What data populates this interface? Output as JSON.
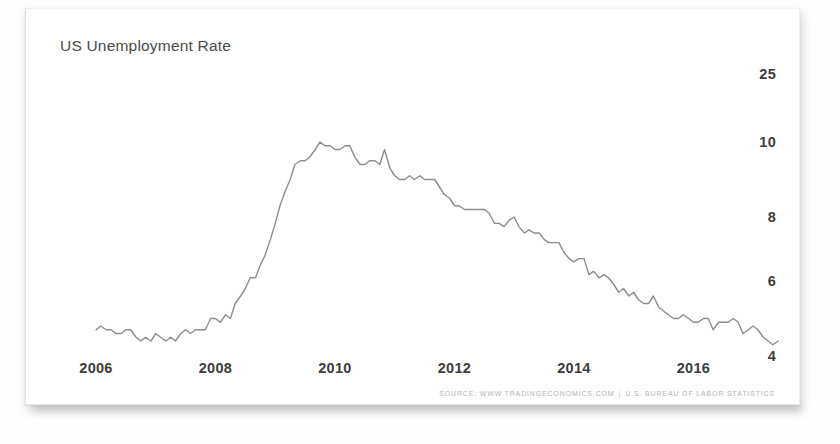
{
  "chart_data": {
    "type": "line",
    "title": "US Unemployment Rate",
    "xlabel": "",
    "ylabel": "",
    "grid": false,
    "legend": null,
    "ylim": [
      4,
      25
    ],
    "xlim": [
      2006.0,
      2017.5
    ],
    "y_ticks": [
      25,
      10,
      8,
      6,
      4
    ],
    "x_ticks": [
      2006,
      2008,
      2010,
      2012,
      2014,
      2016
    ],
    "line_color": "#8d8d8d",
    "units": "percent",
    "series": [
      {
        "name": "US Unemployment Rate",
        "x": [
          2006.0,
          2006.08,
          2006.17,
          2006.25,
          2006.33,
          2006.42,
          2006.5,
          2006.58,
          2006.67,
          2006.75,
          2006.83,
          2006.92,
          2007.0,
          2007.08,
          2007.17,
          2007.25,
          2007.33,
          2007.42,
          2007.5,
          2007.58,
          2007.67,
          2007.75,
          2007.83,
          2007.92,
          2008.0,
          2008.08,
          2008.17,
          2008.25,
          2008.33,
          2008.42,
          2008.5,
          2008.58,
          2008.67,
          2008.75,
          2008.83,
          2008.92,
          2009.0,
          2009.08,
          2009.17,
          2009.25,
          2009.33,
          2009.42,
          2009.5,
          2009.58,
          2009.67,
          2009.75,
          2009.83,
          2009.92,
          2010.0,
          2010.08,
          2010.17,
          2010.25,
          2010.33,
          2010.42,
          2010.5,
          2010.58,
          2010.67,
          2010.75,
          2010.83,
          2010.92,
          2011.0,
          2011.08,
          2011.17,
          2011.25,
          2011.33,
          2011.42,
          2011.5,
          2011.58,
          2011.67,
          2011.75,
          2011.83,
          2011.92,
          2012.0,
          2012.08,
          2012.17,
          2012.25,
          2012.33,
          2012.42,
          2012.5,
          2012.58,
          2012.67,
          2012.75,
          2012.83,
          2012.92,
          2013.0,
          2013.08,
          2013.17,
          2013.25,
          2013.33,
          2013.42,
          2013.5,
          2013.58,
          2013.67,
          2013.75,
          2013.83,
          2013.92,
          2014.0,
          2014.08,
          2014.17,
          2014.25,
          2014.33,
          2014.42,
          2014.5,
          2014.58,
          2014.67,
          2014.75,
          2014.83,
          2014.92,
          2015.0,
          2015.08,
          2015.17,
          2015.25,
          2015.33,
          2015.42,
          2015.5,
          2015.58,
          2015.67,
          2015.75,
          2015.83,
          2015.92,
          2016.0,
          2016.08,
          2016.17,
          2016.25,
          2016.33,
          2016.42,
          2016.5,
          2016.58,
          2016.67,
          2016.75,
          2016.83,
          2016.92,
          2017.0,
          2017.08,
          2017.17,
          2017.25,
          2017.33,
          2017.42
        ],
        "values": [
          4.7,
          4.8,
          4.7,
          4.7,
          4.6,
          4.6,
          4.7,
          4.7,
          4.5,
          4.4,
          4.5,
          4.4,
          4.6,
          4.5,
          4.4,
          4.5,
          4.4,
          4.6,
          4.7,
          4.6,
          4.7,
          4.7,
          4.7,
          5.0,
          5.0,
          4.9,
          5.1,
          5.0,
          5.4,
          5.6,
          5.8,
          6.1,
          6.1,
          6.5,
          6.8,
          7.3,
          7.8,
          8.3,
          8.7,
          9.0,
          9.4,
          9.5,
          9.5,
          9.6,
          9.8,
          10.0,
          9.9,
          9.9,
          9.8,
          9.8,
          9.9,
          9.9,
          9.6,
          9.4,
          9.4,
          9.5,
          9.5,
          9.4,
          9.8,
          9.3,
          9.1,
          9.0,
          9.0,
          9.1,
          9.0,
          9.1,
          9.0,
          9.0,
          9.0,
          8.8,
          8.6,
          8.5,
          8.3,
          8.3,
          8.2,
          8.2,
          8.2,
          8.2,
          8.2,
          8.1,
          7.8,
          7.8,
          7.7,
          7.9,
          8.0,
          7.7,
          7.5,
          7.6,
          7.5,
          7.5,
          7.3,
          7.2,
          7.2,
          7.2,
          6.9,
          6.7,
          6.6,
          6.7,
          6.7,
          6.2,
          6.3,
          6.1,
          6.2,
          6.1,
          5.9,
          5.7,
          5.8,
          5.6,
          5.7,
          5.5,
          5.4,
          5.4,
          5.6,
          5.3,
          5.2,
          5.1,
          5.0,
          5.0,
          5.1,
          5.0,
          4.9,
          4.9,
          5.0,
          5.0,
          4.7,
          4.9,
          4.9,
          4.9,
          5.0,
          4.9,
          4.6,
          4.7,
          4.8,
          4.7,
          4.5,
          4.4,
          4.3,
          4.4
        ]
      }
    ]
  },
  "footer": {
    "source_text": "SOURCE: WWW.TRADINGECONOMICS.COM",
    "separator": "|",
    "agency_text": "U.S. BUREAU OF LABOR STATISTICS"
  }
}
